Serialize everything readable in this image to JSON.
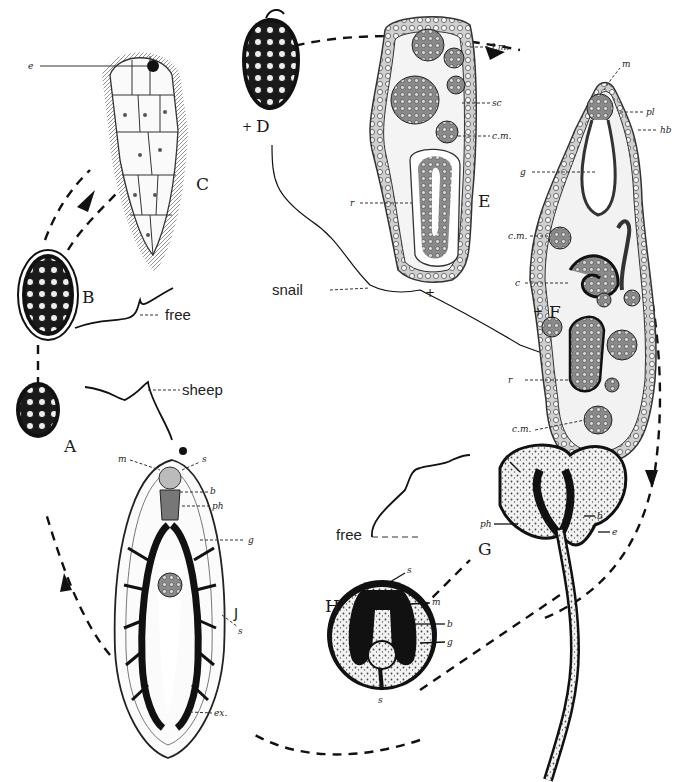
{
  "diagram": {
    "stages": [
      {
        "id": "A",
        "label": "A"
      },
      {
        "id": "B",
        "label": "B"
      },
      {
        "id": "C",
        "label": "C"
      },
      {
        "id": "D",
        "label": "D"
      },
      {
        "id": "E",
        "label": "E"
      },
      {
        "id": "F",
        "label": "F"
      },
      {
        "id": "G",
        "label": "G"
      },
      {
        "id": "H",
        "label": "H"
      },
      {
        "id": "J",
        "label": "J"
      }
    ],
    "hosts": {
      "sheep": "sheep",
      "free_top": "free",
      "snail": "snail",
      "free_bottom": "free"
    },
    "part_labels": {
      "C": {
        "e": "e"
      },
      "E": {
        "lm": "l.m.",
        "sc": "sc",
        "cm": "c.m.",
        "r": "r"
      },
      "F": {
        "m": "m",
        "pl": "pl",
        "hb": "hb",
        "g": "g",
        "cm": "c.m.",
        "c": "c",
        "r": "r",
        "cm2": "c.m."
      },
      "G": {
        "s": "s",
        "ph": "ph",
        "b": "b",
        "e": "e"
      },
      "H": {
        "s": "s",
        "m": "m",
        "b": "b",
        "g": "g",
        "s2": "s"
      },
      "J": {
        "m": "m",
        "s": "s",
        "b": "b",
        "ph": "ph",
        "g": "g",
        "s2": "s",
        "ex": "ex."
      }
    }
  }
}
